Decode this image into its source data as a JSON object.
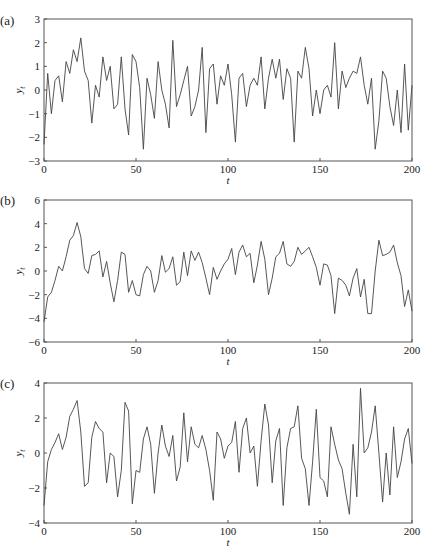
{
  "figure": {
    "panels": [
      {
        "label": "(a)",
        "ylabel": "y_t",
        "xlabel": "t"
      },
      {
        "label": "(b)",
        "ylabel": "y_t",
        "xlabel": "t"
      },
      {
        "label": "(c)",
        "ylabel": "y_t",
        "xlabel": "t"
      }
    ]
  },
  "colors": {
    "line": "#444444",
    "axis": "#555555",
    "background": "#ffffff"
  },
  "chart_data": [
    {
      "type": "line",
      "title": "(a)",
      "xlabel": "t",
      "ylabel": "y_t",
      "xlim": [
        0,
        200
      ],
      "ylim": [
        -3,
        3
      ],
      "xticks": [
        0,
        50,
        100,
        150,
        200
      ],
      "yticks": [
        -3,
        -2,
        -1,
        0,
        1,
        2,
        3
      ],
      "grid": false,
      "x_step": 2,
      "values": [
        -2.3,
        0.7,
        -1.0,
        0.4,
        0.6,
        -0.5,
        1.2,
        0.7,
        1.7,
        1.2,
        2.2,
        0.8,
        0.4,
        -1.4,
        0.2,
        -0.3,
        1.4,
        0.4,
        1.0,
        -0.8,
        -0.6,
        1.4,
        -0.8,
        -1.9,
        1.5,
        1.2,
        0.1,
        -2.5,
        0.5,
        -0.2,
        -1.2,
        1.2,
        0.0,
        -0.6,
        -1.6,
        2.1,
        -0.7,
        -0.2,
        0.4,
        1.0,
        -1.1,
        -0.7,
        0.0,
        1.8,
        -1.8,
        0.9,
        1.1,
        -0.6,
        0.6,
        0.2,
        1.1,
        -0.2,
        -2.2,
        0.5,
        0.7,
        -0.7,
        0.2,
        0.5,
        0.2,
        1.4,
        -0.8,
        0.5,
        1.3,
        0.5,
        1.3,
        -0.4,
        0.9,
        0.5,
        -2.2,
        0.8,
        0.5,
        1.8,
        0.9,
        -1.1,
        0.0,
        -1.0,
        0.0,
        0.2,
        -0.3,
        2.0,
        -0.8,
        0.8,
        0.1,
        0.5,
        0.8,
        0.7,
        1.4,
        0.2,
        -0.6,
        0.5,
        -2.5,
        -1.3,
        0.8,
        0.5,
        -0.7,
        -1.5,
        0.0,
        -1.8,
        1.1,
        -1.7,
        0.2
      ]
    },
    {
      "type": "line",
      "title": "(b)",
      "xlabel": "t",
      "ylabel": "y_t",
      "xlim": [
        0,
        200
      ],
      "ylim": [
        -6,
        6
      ],
      "xticks": [
        0,
        50,
        100,
        150,
        200
      ],
      "yticks": [
        -6,
        -4,
        -2,
        0,
        2,
        4,
        6
      ],
      "grid": false,
      "x_step": 2,
      "values": [
        -4.3,
        -2.2,
        -1.8,
        -0.8,
        0.4,
        0.0,
        1.2,
        2.6,
        3.0,
        4.1,
        2.9,
        0.2,
        -0.2,
        1.3,
        1.4,
        1.7,
        -0.5,
        0.8,
        -1.0,
        -2.6,
        -0.8,
        1.6,
        1.4,
        -1.8,
        -0.8,
        -2.0,
        -2.1,
        -0.3,
        0.4,
        0.0,
        -1.8,
        -0.8,
        1.3,
        -0.1,
        0.2,
        1.2,
        -1.2,
        -0.9,
        1.6,
        -0.4,
        1.7,
        0.9,
        1.6,
        0.7,
        -0.6,
        -2.0,
        0.3,
        -0.7,
        0.0,
        0.6,
        1.0,
        1.9,
        -0.3,
        1.6,
        2.2,
        1.2,
        1.5,
        -1.0,
        0.5,
        2.5,
        1.0,
        -2.0,
        -0.6,
        1.2,
        1.5,
        2.5,
        0.6,
        0.4,
        0.8,
        2.0,
        1.4,
        1.7,
        2.0,
        1.2,
        0.3,
        -1.2,
        0.6,
        0.5,
        -0.4,
        -3.6,
        -0.6,
        -0.8,
        -1.2,
        -2.1,
        -0.6,
        0.2,
        -2.2,
        -0.7,
        -3.6,
        -3.6,
        0.0,
        2.6,
        1.3,
        1.4,
        1.6,
        2.2,
        0.7,
        -0.4,
        -3.0,
        -1.6,
        -3.4
      ]
    },
    {
      "type": "line",
      "title": "(c)",
      "xlabel": "t",
      "ylabel": "y_t",
      "xlim": [
        0,
        200
      ],
      "ylim": [
        -4,
        4
      ],
      "xticks": [
        0,
        50,
        100,
        150,
        200
      ],
      "yticks": [
        -4,
        -2,
        0,
        2,
        4
      ],
      "grid": false,
      "x_step": 2,
      "values": [
        -3.0,
        -0.5,
        0.2,
        0.6,
        1.1,
        0.2,
        0.9,
        2.1,
        2.5,
        3.0,
        1.2,
        -1.9,
        -1.7,
        0.9,
        1.8,
        1.4,
        1.2,
        -1.7,
        0.0,
        -0.2,
        -2.5,
        -1.0,
        2.9,
        2.4,
        -2.9,
        -1.0,
        -1.1,
        0.8,
        1.5,
        0.5,
        -2.3,
        0.0,
        1.6,
        0.4,
        -0.2,
        1.0,
        -1.6,
        -0.8,
        2.3,
        -0.5,
        1.5,
        0.5,
        0.3,
        1.0,
        0.2,
        -1.0,
        -2.7,
        1.2,
        0.8,
        -0.3,
        0.4,
        0.6,
        1.8,
        -1.1,
        1.4,
        2.0,
        0.0,
        0.4,
        -1.9,
        0.7,
        2.8,
        1.6,
        -1.7,
        0.7,
        1.4,
        -3.0,
        0.3,
        1.4,
        1.5,
        2.7,
        -0.3,
        -0.9,
        -3.0,
        -0.5,
        2.5,
        -1.4,
        -1.6,
        -2.5,
        1.5,
        0.5,
        -0.4,
        -0.9,
        -2.3,
        -3.5,
        0.5,
        -2.5,
        3.7,
        0.0,
        0.3,
        1.2,
        2.7,
        0.0,
        -2.8,
        0.0,
        -2.4,
        1.5,
        -1.4,
        -0.5,
        0.8,
        1.4,
        -0.6
      ]
    }
  ]
}
